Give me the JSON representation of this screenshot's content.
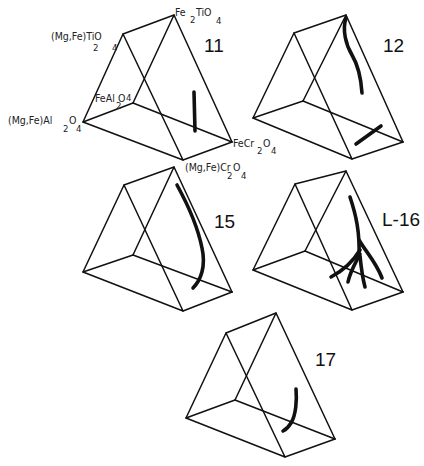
{
  "figure": {
    "type": "ternary-prism-diagrams",
    "vertex_labels": {
      "top_front": {
        "base": "(Mg,Fe)TiO",
        "sub1": "2",
        "sub2": "4"
      },
      "top_back": {
        "base": "Fe",
        "sub1": "2",
        "mid": "TiO",
        "sub2": "4"
      },
      "left_back": {
        "base": "FeAl",
        "sub1": "2",
        "mid": "O",
        "sub2": "4"
      },
      "left_front": {
        "base": "(Mg,Fe)Al",
        "sub1": "2",
        "mid": "O",
        "sub2": "4"
      },
      "right_back": {
        "base": "FeCr",
        "sub1": "2",
        "mid": "O",
        "sub2": "4"
      },
      "right_front": {
        "base": "(Mg,Fe)Cr",
        "sub1": "2",
        "mid": "O",
        "sub2": "4"
      }
    },
    "panels": [
      {
        "id": "11",
        "label": "11"
      },
      {
        "id": "12",
        "label": "12"
      },
      {
        "id": "15",
        "label": "15"
      },
      {
        "id": "L-16",
        "label": "L-16"
      },
      {
        "id": "17",
        "label": "17"
      }
    ]
  }
}
